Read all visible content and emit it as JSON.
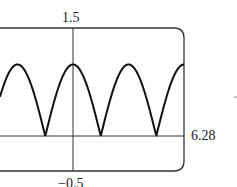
{
  "chart_data": {
    "type": "line",
    "title": "",
    "function": "y = |cos x|",
    "xlabel": "",
    "ylabel": "",
    "xlim": [
      -4.1,
      6.28
    ],
    "ylim": [
      -0.5,
      1.5
    ],
    "tick_labels": {
      "ymax": "1.5",
      "ymin": "−0.5",
      "xmax": "6.28"
    },
    "grid": false,
    "series": [
      {
        "name": "|cos x|",
        "period": 3.14159,
        "peak": 1,
        "min": 0
      }
    ]
  },
  "labels": {
    "ymax": "1.5",
    "ymin": "−0.5",
    "xmax": "6.28",
    "dash": "-"
  }
}
